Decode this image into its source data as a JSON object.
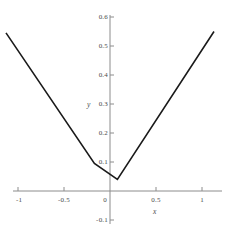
{
  "chart_data": {
    "type": "line",
    "title": "",
    "xlabel": "x",
    "ylabel": "y",
    "xlim": [
      -1.18,
      1.18
    ],
    "ylim": [
      -0.12,
      0.62
    ],
    "grid": false,
    "legend": null,
    "series": [
      {
        "name": "curve",
        "color": "#1a1a1a",
        "x": [
          -1.13,
          -0.17,
          0.08,
          1.13
        ],
        "y": [
          0.545,
          0.095,
          0.04,
          0.55
        ]
      }
    ],
    "xticks": [
      {
        "value": -1,
        "label": "-1"
      },
      {
        "value": -0.5,
        "label": "-0.5"
      },
      {
        "value": 0,
        "label": "0"
      },
      {
        "value": 0.5,
        "label": "0.5"
      },
      {
        "value": 1,
        "label": "1"
      }
    ],
    "yticks": [
      {
        "value": 0.6,
        "label": "0.6"
      },
      {
        "value": 0.5,
        "label": "0.5"
      },
      {
        "value": 0.4,
        "label": "0.4"
      },
      {
        "value": 0.3,
        "label": "0.3"
      },
      {
        "value": 0.2,
        "label": "0.2"
      },
      {
        "value": 0.1,
        "label": "0.1"
      },
      {
        "value": -0.1,
        "label": "-0.1"
      }
    ],
    "origin_label": "0",
    "axis_color": "#8c8c8c",
    "curve_color": "#1a1a1a",
    "label_color": "#4a4a4a",
    "background": "#ffffff"
  },
  "ticks": {
    "x": {
      "neg_one": "-1",
      "neg_half": "-0.5",
      "zero": "0",
      "pos_half": "0.5",
      "pos_one": "1"
    },
    "y": {
      "p6": "0.6",
      "p5": "0.5",
      "p4": "0.4",
      "p3": "0.3",
      "p2": "0.2",
      "p1": "0.1",
      "m1": "-0.1"
    }
  },
  "axes": {
    "x_name": "x",
    "y_name": "y"
  }
}
